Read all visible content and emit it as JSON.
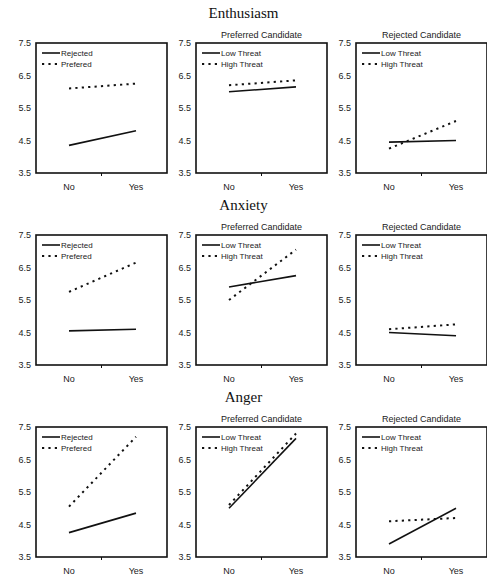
{
  "sections": [
    {
      "title": "Enthusiasm"
    },
    {
      "title": "Anxiety"
    },
    {
      "title": "Anger"
    }
  ],
  "chart_data": [
    {
      "type": "line",
      "section": "Enthusiasm",
      "title": "",
      "categories": [
        "No",
        "Yes"
      ],
      "ylim": [
        3.5,
        7.5
      ],
      "yticks": [
        3.5,
        4.5,
        5.5,
        6.5,
        7.5
      ],
      "legend_position": "upper-left",
      "series": [
        {
          "name": "Rejected",
          "style": "solid",
          "values": [
            4.35,
            4.8
          ]
        },
        {
          "name": "Prefered",
          "style": "dashed",
          "values": [
            6.1,
            6.25
          ]
        }
      ]
    },
    {
      "type": "line",
      "section": "Enthusiasm",
      "title": "Preferred Candidate",
      "categories": [
        "No",
        "Yes"
      ],
      "ylim": [
        3.5,
        7.5
      ],
      "yticks": [
        3.5,
        4.5,
        5.5,
        6.5,
        7.5
      ],
      "legend_position": "upper-left",
      "series": [
        {
          "name": "Low Threat",
          "style": "solid",
          "values": [
            6.0,
            6.15
          ]
        },
        {
          "name": "High Threat",
          "style": "dashed",
          "values": [
            6.2,
            6.35
          ]
        }
      ]
    },
    {
      "type": "line",
      "section": "Enthusiasm",
      "title": "Rejected Candidate",
      "categories": [
        "No",
        "Yes"
      ],
      "ylim": [
        3.5,
        7.5
      ],
      "yticks": [
        3.5,
        4.5,
        5.5,
        6.5,
        7.5
      ],
      "legend_position": "upper-left",
      "series": [
        {
          "name": "Low Threat",
          "style": "solid",
          "values": [
            4.45,
            4.5
          ]
        },
        {
          "name": "High Threat",
          "style": "dashed",
          "values": [
            4.25,
            5.1
          ]
        }
      ]
    },
    {
      "type": "line",
      "section": "Anxiety",
      "title": "",
      "categories": [
        "No",
        "Yes"
      ],
      "ylim": [
        3.5,
        7.5
      ],
      "yticks": [
        3.5,
        4.5,
        5.5,
        6.5,
        7.5
      ],
      "legend_position": "upper-left",
      "series": [
        {
          "name": "Rejected",
          "style": "solid",
          "values": [
            4.55,
            4.6
          ]
        },
        {
          "name": "Prefered",
          "style": "dashed",
          "values": [
            5.75,
            6.65
          ]
        }
      ]
    },
    {
      "type": "line",
      "section": "Anxiety",
      "title": "Preferred Candidate",
      "categories": [
        "No",
        "Yes"
      ],
      "ylim": [
        3.5,
        7.5
      ],
      "yticks": [
        3.5,
        4.5,
        5.5,
        6.5,
        7.5
      ],
      "legend_position": "upper-left",
      "series": [
        {
          "name": "Low Threat",
          "style": "solid",
          "values": [
            5.9,
            6.25
          ]
        },
        {
          "name": "High Threat",
          "style": "dashed",
          "values": [
            5.5,
            7.05
          ]
        }
      ]
    },
    {
      "type": "line",
      "section": "Anxiety",
      "title": "Rejected Candidate",
      "categories": [
        "No",
        "Yes"
      ],
      "ylim": [
        3.5,
        7.5
      ],
      "yticks": [
        3.5,
        4.5,
        5.5,
        6.5,
        7.5
      ],
      "legend_position": "upper-left",
      "series": [
        {
          "name": "Low Threat",
          "style": "solid",
          "values": [
            4.5,
            4.4
          ]
        },
        {
          "name": "High Threat",
          "style": "dashed",
          "values": [
            4.6,
            4.75
          ]
        }
      ]
    },
    {
      "type": "line",
      "section": "Anger",
      "title": "",
      "categories": [
        "No",
        "Yes"
      ],
      "ylim": [
        3.5,
        7.5
      ],
      "yticks": [
        3.5,
        4.5,
        5.5,
        6.5,
        7.5
      ],
      "legend_position": "upper-left",
      "series": [
        {
          "name": "Rejected",
          "style": "solid",
          "values": [
            4.25,
            4.85
          ]
        },
        {
          "name": "Prefered",
          "style": "dashed",
          "values": [
            5.05,
            7.2
          ]
        }
      ]
    },
    {
      "type": "line",
      "section": "Anger",
      "title": "Preferred Candidate",
      "categories": [
        "No",
        "Yes"
      ],
      "ylim": [
        3.5,
        7.5
      ],
      "yticks": [
        3.5,
        4.5,
        5.5,
        6.5,
        7.5
      ],
      "legend_position": "upper-left",
      "series": [
        {
          "name": "Low Threat",
          "style": "solid",
          "values": [
            5.0,
            7.15
          ]
        },
        {
          "name": "High Threat",
          "style": "dashed",
          "values": [
            5.1,
            7.3
          ]
        }
      ]
    },
    {
      "type": "line",
      "section": "Anger",
      "title": "Rejected Candidate",
      "categories": [
        "No",
        "Yes"
      ],
      "ylim": [
        3.5,
        7.5
      ],
      "yticks": [
        3.5,
        4.5,
        5.5,
        6.5,
        7.5
      ],
      "legend_position": "upper-left",
      "series": [
        {
          "name": "Low Threat",
          "style": "solid",
          "values": [
            3.9,
            5.0
          ]
        },
        {
          "name": "High Threat",
          "style": "dashed",
          "values": [
            4.6,
            4.7
          ]
        }
      ]
    }
  ]
}
